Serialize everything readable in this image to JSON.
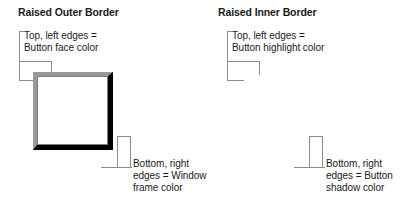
{
  "figure": {
    "line_color": "#8c8c8c",
    "text_color": "#1a1a1a"
  },
  "panels": [
    {
      "id": "raised-outer-border",
      "heading": "Raised Outer Border",
      "box": {
        "top_left_color": "#9a9a9a",
        "bottom_right_color": "#000000",
        "face_color": "#ffffff"
      },
      "callouts": {
        "top_left": "Top, left edges =\nButton face color",
        "bottom_right": "Bottom, right\nedges = Window\nframe color"
      }
    },
    {
      "id": "raised-inner-border",
      "heading": "Raised Inner Border",
      "box": {
        "top_left_color": "#fdfdfd",
        "bottom_right_color": "#5c5c5c",
        "face_color": "#ffffff"
      },
      "callouts": {
        "top_left": "Top, left edges =\nButton highlight color",
        "bottom_right": "Bottom, right\nedges = Button\nshadow color"
      }
    }
  ]
}
